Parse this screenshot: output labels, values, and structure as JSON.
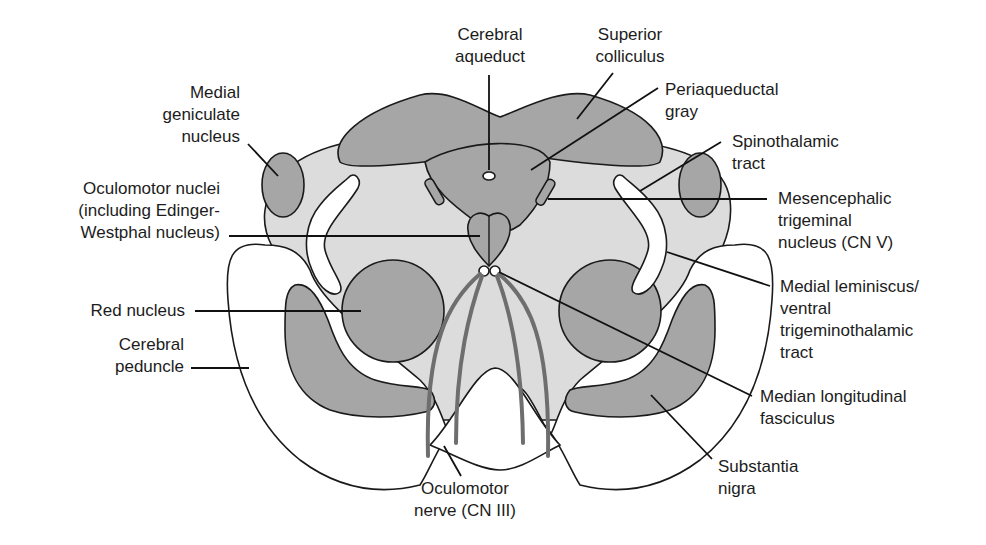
{
  "figure": {
    "colors": {
      "dark_gray": "#a6a6a6",
      "light_gray": "#dcdcdc",
      "white": "#ffffff",
      "outline": "#1a1a1a",
      "nerve": "#6e6e6e"
    },
    "labels": {
      "cerebral_aqueduct": [
        "Cerebral",
        "aqueduct"
      ],
      "superior_colliculus": [
        "Superior",
        "colliculus"
      ],
      "periaqueductal_gray": [
        "Periaqueductal",
        "gray"
      ],
      "medial_geniculate": [
        "Medial",
        "geniculate",
        "nucleus"
      ],
      "spinothalamic": [
        "Spinothalamic",
        "tract"
      ],
      "oculomotor_nuclei": [
        "Oculomotor nuclei",
        "(including Edinger-",
        "Westphal nucleus)"
      ],
      "mesencephalic_trigeminal": [
        "Mesencephalic",
        "trigeminal",
        "nucleus (CN V)"
      ],
      "medial_lemniscus": [
        "Medial leminiscus/",
        "ventral",
        "trigeminothalamic",
        "tract"
      ],
      "red_nucleus": [
        "Red nucleus"
      ],
      "cerebral_peduncle": [
        "Cerebral",
        "peduncle"
      ],
      "median_longitudinal_fasciculus": [
        "Median longitudinal",
        "fasciculus"
      ],
      "substantia_nigra": [
        "Substantia",
        "nigra"
      ],
      "oculomotor_nerve": [
        "Oculomotor",
        "nerve (CN III)"
      ]
    }
  }
}
